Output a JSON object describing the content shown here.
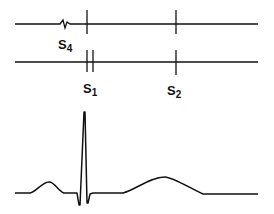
{
  "figure": {
    "stroke_color": "#111111",
    "background": "#ffffff"
  },
  "phonocardiogram": {
    "trace_1": {
      "label_main": "S",
      "label_sub": "4",
      "events": [
        "S4 gallop",
        "S1",
        "S2"
      ]
    },
    "trace_2": {
      "events": [
        "S1 split",
        "S2"
      ]
    },
    "labels": [
      {
        "main": "S",
        "sub": "4"
      },
      {
        "main": "S",
        "sub": "1"
      },
      {
        "main": "S",
        "sub": "2"
      }
    ]
  },
  "ecg": {
    "waves": [
      "P",
      "QRS",
      "T"
    ]
  }
}
